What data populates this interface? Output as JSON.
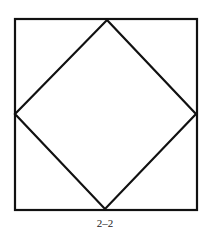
{
  "figure": {
    "caption": "2–2",
    "stroke_color": "#111111",
    "outer_square": {
      "x": 15,
      "y": 19,
      "width": 182,
      "height": 191
    },
    "inner_diamond": {
      "top": [
        107,
        20
      ],
      "right": [
        196,
        114
      ],
      "bottom": [
        105,
        209
      ],
      "left": [
        15,
        114
      ]
    }
  }
}
